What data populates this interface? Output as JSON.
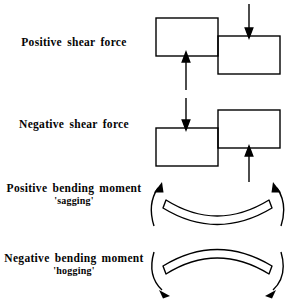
{
  "figure": {
    "background_color": "#ffffff",
    "line_color": "#000000"
  },
  "rows": [
    {
      "id": "positive-shear-force",
      "label_line1": "Positive shear force",
      "label_line2": "",
      "diagram_type": "shear-blocks",
      "description": "Left block raised, right block lowered; upward arrow under left block, downward arrow above right block"
    },
    {
      "id": "negative-shear-force",
      "label_line1": "Negative shear force",
      "label_line2": "",
      "diagram_type": "shear-blocks",
      "description": "Left block lowered, right block raised; downward arrow above left block, upward arrow under right block"
    },
    {
      "id": "positive-bending-moment",
      "label_line1": "Positive bending moment",
      "label_line2": "'sagging'",
      "diagram_type": "bending-beam",
      "description": "Beam curved concave upward with curved arrows sweeping up and inward at both ends"
    },
    {
      "id": "negative-bending-moment",
      "label_line1": "Negative bending moment",
      "label_line2": "'hogging'",
      "diagram_type": "bending-beam",
      "description": "Beam curved concave downward with curved arrows sweeping down and outward at both ends"
    }
  ]
}
